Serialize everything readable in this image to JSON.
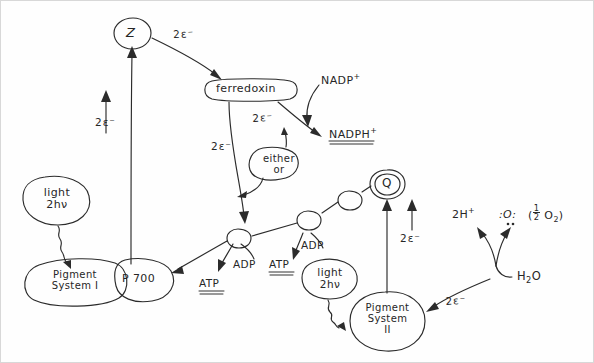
{
  "diagram": {
    "type": "hand-drawn-diagram",
    "background_color": "#fefefe",
    "ink_color": "#2b2b2b"
  },
  "nodes": {
    "z": {
      "label": "Z",
      "shape": "circle"
    },
    "ferredoxin": {
      "label": "ferredoxin",
      "shape": "rounded-oval"
    },
    "nadph": {
      "label_main": "NADPH",
      "label_sup": "+",
      "underline": "double"
    },
    "nadp_plus": {
      "label_main": "NADP",
      "label_sup": "+"
    },
    "either_or": {
      "line1": "either",
      "line2": "or",
      "shape": "speech-bubble"
    },
    "q": {
      "label": "Q",
      "shape": "double-circle"
    },
    "light_left": {
      "line1": "light",
      "line2": "2hν",
      "shape": "oval"
    },
    "light_right": {
      "line1": "light",
      "line2": "2hν",
      "shape": "oval"
    },
    "pigment_system_1": {
      "line1": "Pigment",
      "line2": "System I",
      "shape": "blob"
    },
    "p700": {
      "label": "P 700",
      "shape": "blob"
    },
    "pigment_system_2": {
      "line1": "Pigment",
      "line2": "System",
      "line3": "II",
      "shape": "circle"
    },
    "water": {
      "label_main": "H",
      "label_sub": "2",
      "label_tail": "O"
    },
    "proton": {
      "label_main": "2H",
      "label_sup": "+"
    },
    "oxygen_atom": {
      "label": ":O:",
      "dots_below": ".."
    },
    "oxygen_molecule": {
      "open_paren": "(",
      "num": "1",
      "den": "2",
      "species_main": "O",
      "species_sub": "2",
      "close_paren": ")"
    },
    "carrier_1": {
      "shape": "circle"
    },
    "carrier_2": {
      "shape": "circle"
    },
    "carrier_3": {
      "shape": "circle"
    }
  },
  "labels": {
    "e2_z_to_ferredoxin": "2ε⁻",
    "e2_up_to_z_left": "2ε⁻",
    "e2_ferredoxin_down": "2ε⁻",
    "e2_ferredoxin_to_nadph": "2ε⁻",
    "e2_up_to_q": "2ε⁻",
    "e2_water_to_ps2": "2ε⁻",
    "adp_left": "ADP",
    "atp_left": "ATP",
    "adp_right": "ADP",
    "atp_right": "ATP"
  },
  "annotations": {
    "atp_underline": "double",
    "nadph_underline": "double"
  }
}
